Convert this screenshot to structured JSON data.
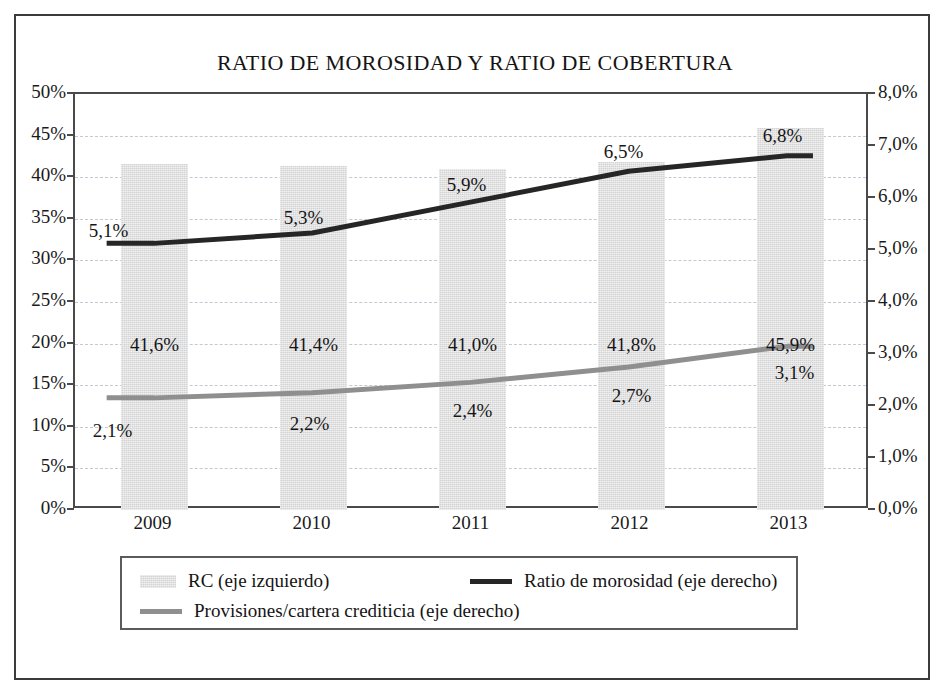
{
  "figure": {
    "title": "RATIO DE MOROSIDAD Y RATIO DE COBERTURA"
  },
  "axes": {
    "left_ticks": [
      "0%",
      "5%",
      "10%",
      "15%",
      "20%",
      "25%",
      "30%",
      "35%",
      "40%",
      "45%",
      "50%"
    ],
    "right_ticks": [
      "0,0%",
      "1,0%",
      "2,0%",
      "3,0%",
      "4,0%",
      "5,0%",
      "6,0%",
      "7,0%",
      "8,0%"
    ],
    "x_ticks": [
      "2009",
      "2010",
      "2011",
      "2012",
      "2013"
    ]
  },
  "legend": {
    "items": [
      {
        "label": "RC (eje izquierdo)",
        "marker": "bar-swatch",
        "color": "#d3d3d3"
      },
      {
        "label": "Ratio de morosidad (eje derecho)",
        "marker": "line-swatch",
        "color": "#262626"
      },
      {
        "label": "Provisiones/cartera crediticia (eje derecho)",
        "marker": "line-swatch",
        "color": "#8f8f8f"
      }
    ]
  },
  "chart_data": {
    "type": "bar",
    "title": "RATIO DE MOROSIDAD Y RATIO DE COBERTURA",
    "xlabel": "",
    "ylabel": "",
    "categories": [
      "2009",
      "2010",
      "2011",
      "2012",
      "2013"
    ],
    "grid": true,
    "legend_position": "bottom",
    "y_left": {
      "label": "",
      "ylim": [
        0,
        50
      ],
      "tick_step": 5,
      "tick_labels": [
        "0%",
        "5%",
        "10%",
        "15%",
        "20%",
        "25%",
        "30%",
        "35%",
        "40%",
        "45%",
        "50%"
      ]
    },
    "y_right": {
      "label": "",
      "ylim": [
        0,
        8
      ],
      "tick_step": 1,
      "tick_labels": [
        "0,0%",
        "1,0%",
        "2,0%",
        "3,0%",
        "4,0%",
        "5,0%",
        "6,0%",
        "7,0%",
        "8,0%"
      ]
    },
    "series": [
      {
        "name": "RC (eje izquierdo)",
        "type": "bar",
        "axis": "left",
        "color": "#d3d3d3",
        "values": [
          41.6,
          41.4,
          41.0,
          41.8,
          45.9
        ],
        "data_labels": [
          "41,6%",
          "41,4%",
          "41,0%",
          "41,8%",
          "45,9%"
        ]
      },
      {
        "name": "Ratio de morosidad (eje derecho)",
        "type": "line",
        "axis": "right",
        "color": "#262626",
        "values": [
          5.1,
          5.3,
          5.9,
          6.5,
          6.8
        ],
        "data_labels": [
          "5,1%",
          "5,3%",
          "5,9%",
          "6,5%",
          "6,8%"
        ]
      },
      {
        "name": "Provisiones/cartera crediticia (eje derecho)",
        "type": "line",
        "axis": "right",
        "color": "#8f8f8f",
        "values": [
          2.1,
          2.2,
          2.4,
          2.7,
          3.1
        ],
        "data_labels": [
          "2,1%",
          "2,2%",
          "2,4%",
          "2,7%",
          "3,1%"
        ]
      }
    ]
  }
}
